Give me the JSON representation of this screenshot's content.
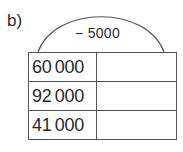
{
  "exercise_label": "b)",
  "operation": "− 5000",
  "rows": [
    {
      "input": "60 000",
      "answer": ""
    },
    {
      "input": "92 000",
      "answer": ""
    },
    {
      "input": "41 000",
      "answer": ""
    }
  ]
}
